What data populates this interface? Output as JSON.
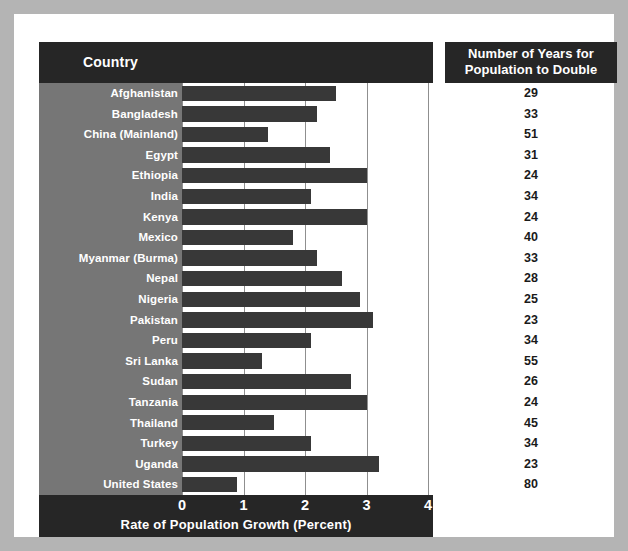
{
  "headers": {
    "country": "Country",
    "years_line1": "Number of Years for",
    "years_line2": "Population to Double"
  },
  "colors": {
    "frame": "#b4b4b4",
    "header_bar": "#262626",
    "label_column": "#767676",
    "bar": "#383838",
    "gridline": "#8f8f8f",
    "plot_background": "#ffffff"
  },
  "chart_data": {
    "type": "bar",
    "title": "",
    "xlabel": "Rate of Population Growth (Percent)",
    "ylabel": "Country",
    "xlim": [
      0,
      4.3
    ],
    "xticks": [
      0,
      1,
      2,
      3,
      4
    ],
    "xtick_labels": [
      "0",
      "1",
      "2",
      "3",
      "4"
    ],
    "grid": true,
    "orientation": "horizontal",
    "legend": "none",
    "categories": [
      "Afghanistan",
      "Bangladesh",
      "China (Mainland)",
      "Egypt",
      "Ethiopia",
      "India",
      "Kenya",
      "Mexico",
      "Myanmar (Burma)",
      "Nepal",
      "Nigeria",
      "Pakistan",
      "Peru",
      "Sri Lanka",
      "Sudan",
      "Tanzania",
      "Thailand",
      "Turkey",
      "Uganda",
      "United States"
    ],
    "series": [
      {
        "name": "Rate of Population Growth (Percent)",
        "values": [
          2.5,
          2.2,
          1.4,
          2.4,
          3.0,
          2.1,
          3.0,
          1.8,
          2.2,
          2.6,
          2.9,
          3.1,
          2.1,
          1.3,
          2.75,
          3.0,
          1.5,
          2.1,
          3.2,
          0.9
        ]
      },
      {
        "name": "Number of Years for Population to Double",
        "values": [
          29,
          33,
          51,
          31,
          24,
          34,
          24,
          40,
          33,
          28,
          25,
          23,
          34,
          55,
          26,
          24,
          45,
          34,
          23,
          80
        ]
      }
    ]
  }
}
